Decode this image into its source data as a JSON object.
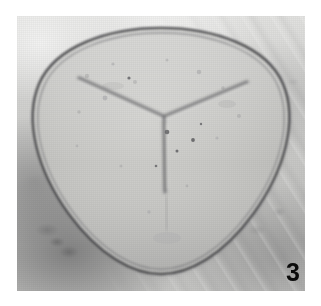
{
  "page": {
    "background_color": "#ffffff",
    "width": 321,
    "height": 306
  },
  "top_text": {
    "fragment_left": "py of a spore",
    "fragment_right": "specimen"
  },
  "plate": {
    "caption_number": "3",
    "kind": "photomicrograph",
    "palette": {
      "background_light": "#e4e4e2",
      "background_mid": "#c6c6c4",
      "background_dark": "#8e8e90",
      "spore_body": "#c4c4c1",
      "spore_wall": "#4a4a4c",
      "figure_number_color": "#0b0b0b"
    },
    "specimen": {
      "name": "trilete-spore",
      "outline_shape": "rounded-triangular",
      "features": [
        "double-contoured exine wall",
        "Y-shaped trilete laesura",
        "granular infrareticulate body",
        "organic debris in background matrix"
      ],
      "laesura": {
        "name": "trilete-mark",
        "ray_count": 3,
        "center_x": 147,
        "center_y": 99,
        "rays": [
          {
            "name": "ray-upper-left",
            "angle_deg": 210
          },
          {
            "name": "ray-upper-right",
            "angle_deg": 330
          },
          {
            "name": "ray-lower",
            "angle_deg": 90
          }
        ]
      }
    }
  }
}
